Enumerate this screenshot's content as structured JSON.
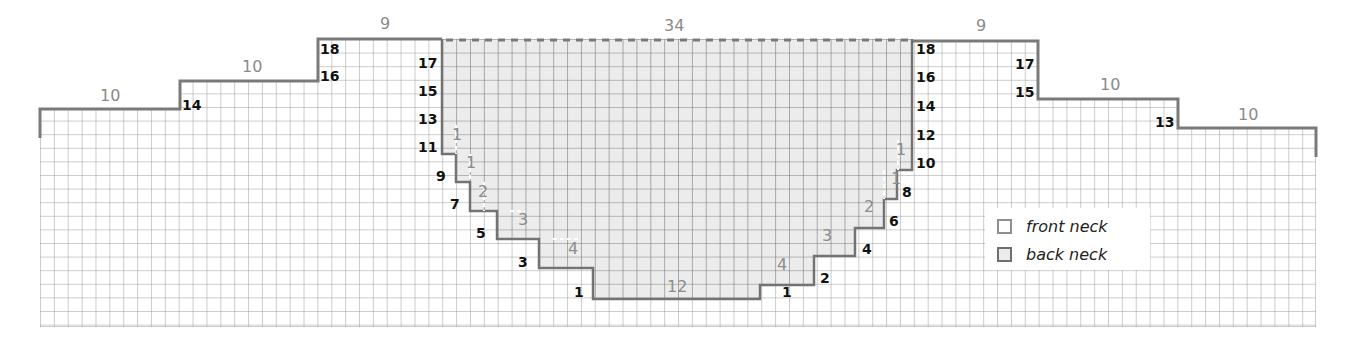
{
  "diagram": {
    "top_counts": {
      "left_shoulder_outer": "10",
      "left_shoulder_middle": "10",
      "left_shoulder_inner": "9",
      "back_neck": "34",
      "right_shoulder_inner": "9",
      "right_shoulder_middle": "10",
      "right_shoulder_outer": "10"
    },
    "left_shoulder_row_labels": [
      "18",
      "16",
      "14"
    ],
    "left_neck_row_labels": [
      "17",
      "15",
      "13",
      "11",
      "9",
      "7",
      "5",
      "3",
      "1"
    ],
    "right_neck_row_labels": [
      "18",
      "16",
      "14",
      "12",
      "10",
      "8",
      "6",
      "4",
      "2",
      "1"
    ],
    "right_shoulder_row_labels": [
      "17",
      "15",
      "13"
    ],
    "front_neck_step_counts_left": [
      "1",
      "1",
      "2",
      "3",
      "4"
    ],
    "front_neck_step_counts_right": [
      "4",
      "3",
      "2",
      "1",
      "1"
    ],
    "front_neck_bottom_count": "12",
    "colors": {
      "grid_line": "#9a9a9a",
      "outline": "#777777",
      "back_neck_fill": "#ececec",
      "count_text": "#8a8a8a",
      "row_number_text": "#111111"
    }
  },
  "legend": {
    "items": [
      {
        "label": "front neck",
        "swatch": "front-neck"
      },
      {
        "label": "back neck",
        "swatch": "back-neck"
      }
    ]
  }
}
